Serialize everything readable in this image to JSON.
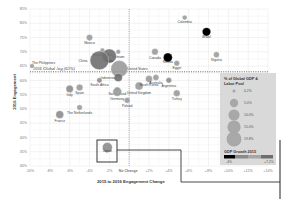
{
  "chart_data": {
    "type": "scatter",
    "title": "",
    "xlabel": "2015 to 2016 Engagement Change",
    "ylabel": "2016 Engagement",
    "xlim": [
      -10,
      14
    ],
    "ylim": [
      30,
      85
    ],
    "grid": true,
    "x_ticks": [
      "-10%",
      "-8%",
      "-6%",
      "-4%",
      "-2%",
      "No Change",
      "+2%",
      "+4%",
      "+6%",
      "+8%",
      "+10%",
      "+12%",
      "+14%"
    ],
    "x_tick_values": [
      -10,
      -8,
      -6,
      -4,
      -2,
      0,
      2,
      4,
      6,
      8,
      10,
      12,
      14
    ],
    "y_ticks": [
      "85%",
      "80%",
      "75%",
      "70%",
      "65%",
      "60%",
      "55%",
      "50%",
      "45%",
      "40%",
      "35%",
      "30%"
    ],
    "y_tick_values": [
      85,
      80,
      75,
      70,
      65,
      60,
      55,
      50,
      45,
      40,
      35,
      30
    ],
    "reference_lines": {
      "global_avg": {
        "label": "2016 Global Avg (63%)",
        "value": 63
      },
      "no_change": {
        "label": "No Change",
        "value": 0
      }
    },
    "points": [
      {
        "name": "Mexico",
        "x": -4.0,
        "y": 75,
        "size": 1.2,
        "growth": "mid"
      },
      {
        "name": "Saudi Arabia",
        "x": -2.7,
        "y": 70.5,
        "size": 0.4,
        "growth": "mid"
      },
      {
        "name": "Vietnam",
        "x": -1.1,
        "y": 70,
        "size": 0.4,
        "growth": "mid"
      },
      {
        "name": "India",
        "x": -2.0,
        "y": 68.5,
        "size": 10.5,
        "growth": "high"
      },
      {
        "name": "China",
        "x": -3.0,
        "y": 67,
        "size": 19.8,
        "growth": "high"
      },
      {
        "name": "Canada",
        "x": 2.6,
        "y": 70,
        "size": 1.3,
        "growth": "mid"
      },
      {
        "name": "The Philippines",
        "x": -9.8,
        "y": 65,
        "size": 0.4,
        "growth": "mid"
      },
      {
        "name": "United States",
        "x": -1.0,
        "y": 64,
        "size": 15.5,
        "growth": "mid"
      },
      {
        "name": "Indonesia",
        "x": -1.1,
        "y": 61,
        "size": 2.5,
        "growth": "high"
      },
      {
        "name": "South Africa",
        "x": -3.0,
        "y": 60,
        "size": 0.6,
        "growth": "low"
      },
      {
        "name": "Switzerland",
        "x": -1.2,
        "y": 57,
        "size": 0.4,
        "growth": "mid"
      },
      {
        "name": "Germany",
        "x": -1.2,
        "y": 56,
        "size": 3.3,
        "growth": "mid"
      },
      {
        "name": "United Kingdom",
        "x": 1.0,
        "y": 58,
        "size": 2.4,
        "growth": "mid"
      },
      {
        "name": "South Korea",
        "x": 2.0,
        "y": 60.5,
        "size": 1.6,
        "growth": "mid"
      },
      {
        "name": "Australia",
        "x": 2.7,
        "y": 61,
        "size": 1.0,
        "growth": "mid"
      },
      {
        "name": "Argentina",
        "x": 4.0,
        "y": 60,
        "size": 0.8,
        "growth": "low"
      },
      {
        "name": "Turkey",
        "x": 4.8,
        "y": 55.5,
        "size": 1.4,
        "growth": "mid"
      },
      {
        "name": "Poland",
        "x": -0.2,
        "y": 53,
        "size": 0.9,
        "growth": "mid"
      },
      {
        "name": "Italy",
        "x": -6.0,
        "y": 57,
        "size": 1.9,
        "growth": "low"
      },
      {
        "name": "Spain",
        "x": -5.0,
        "y": 57.5,
        "size": 1.4,
        "growth": "mid"
      },
      {
        "name": "The Netherlands",
        "x": -5.0,
        "y": 50.5,
        "size": 0.7,
        "growth": "mid"
      },
      {
        "name": "France",
        "x": -7.0,
        "y": 48,
        "size": 2.3,
        "growth": "low"
      },
      {
        "name": "Japan",
        "x": -2.2,
        "y": 36.5,
        "size": 4.3,
        "growth": "low"
      },
      {
        "name": "Colombia",
        "x": 5.6,
        "y": 82,
        "size": 0.5,
        "growth": "mid"
      },
      {
        "name": "Brazil",
        "x": 7.8,
        "y": 77,
        "size": 2.8,
        "growth": "lowest"
      },
      {
        "name": "Russia",
        "x": 3.9,
        "y": 68,
        "size": 3.3,
        "growth": "lowest"
      },
      {
        "name": "Egypt",
        "x": 4.8,
        "y": 66,
        "size": 0.8,
        "growth": "mid"
      },
      {
        "name": "Nigeria",
        "x": 8.8,
        "y": 69,
        "size": 0.9,
        "growth": "mid"
      }
    ],
    "legend": {
      "size_title": "% of Global GDP & Labor Pool",
      "size_entries": [
        "0.2%",
        "5.0%",
        "10.0%",
        "15.0%",
        "19.8%"
      ],
      "color_title": "GDP Growth 2015",
      "color_min": "-4%",
      "color_max": "+7.2%",
      "position": "right-inside"
    },
    "annotations": [
      "Japan highlighted with callout box"
    ]
  },
  "colors": {
    "grid": "#e4e4e4",
    "point_mid": "#8a8a8a",
    "point_dark": "#000000",
    "legend_bg": "#d9d9d9",
    "callout": "#333333"
  }
}
